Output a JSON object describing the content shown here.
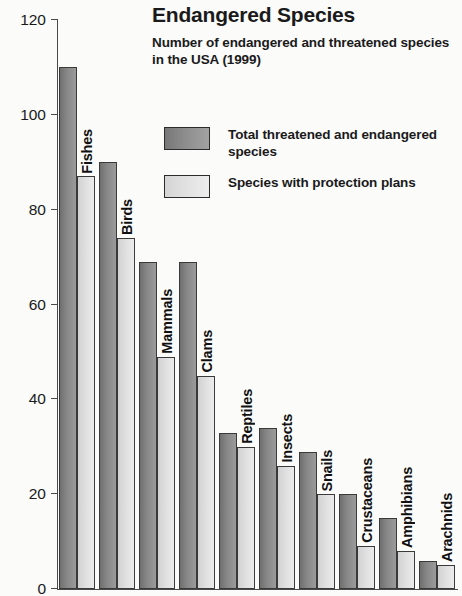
{
  "chart_data": {
    "type": "bar",
    "title": "Endangered Species",
    "subtitle": "Number of endangered and threatened species in the USA (1999)",
    "xlabel": "",
    "ylabel": "",
    "ylim": [
      0,
      120
    ],
    "ytick_values": [
      120,
      100,
      80,
      60,
      40,
      20,
      0
    ],
    "ytick_labels": [
      "120",
      "100",
      "80",
      "60",
      "40",
      "20",
      "0"
    ],
    "grid": false,
    "legend_position": "top-right",
    "categories": [
      "Fishes",
      "Birds",
      "Mammals",
      "Clams",
      "Reptiles",
      "Insects",
      "Snails",
      "Crustaceans",
      "Amphibians",
      "Arachnids"
    ],
    "series": [
      {
        "name": "Total threatened and endangered species",
        "color": "#8a8a8a",
        "values": [
          110,
          90,
          69,
          69,
          33,
          34,
          29,
          20,
          15,
          6
        ]
      },
      {
        "name": "Species with protection plans",
        "color": "#e0e0e0",
        "values": [
          87,
          74,
          49,
          45,
          30,
          26,
          20,
          9,
          8,
          5
        ]
      }
    ]
  },
  "legend": {
    "items": [
      {
        "label": "Total threatened and endangered species",
        "swatch": "dark"
      },
      {
        "label": "Species with protection plans",
        "swatch": "light"
      }
    ]
  }
}
